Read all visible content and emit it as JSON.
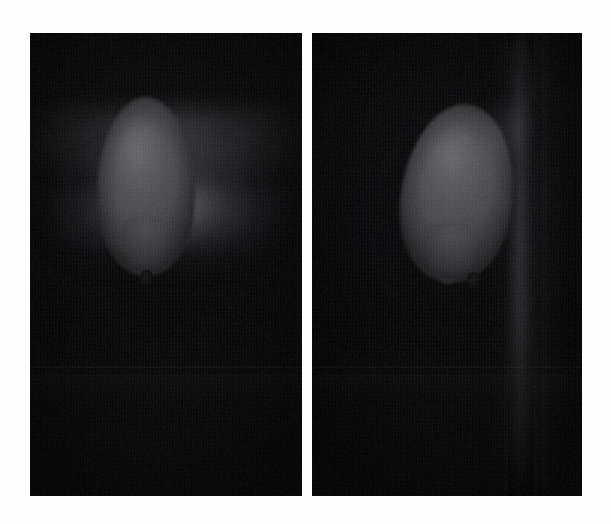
{
  "figure": {
    "background_color": "#fefefe",
    "width": 611,
    "height": 524,
    "caption": "",
    "panel_count": 2
  },
  "panels": [
    {
      "id": "left",
      "label": "",
      "caption": "",
      "frame": {
        "x": 30,
        "y": 33,
        "width": 272,
        "height": 463
      },
      "background_color": "#09090b",
      "subject": "balloon",
      "subject_color": "#4c4c50",
      "subject_position": "upper-center",
      "lighting": "diffuse glow above balloon",
      "glow_color": "#cdcdd2",
      "has_knot": true,
      "knot_color": "#0d0d0f",
      "has_streak": false
    },
    {
      "id": "right",
      "label": "",
      "caption": "",
      "frame": {
        "x": 312,
        "y": 33,
        "width": 270,
        "height": 463
      },
      "background_color": "#08080a",
      "subject": "balloon",
      "subject_color": "#4e4e52",
      "subject_position": "upper-center-left",
      "subject_rotation_deg": 7,
      "lighting": "vertical light streak right of balloon",
      "glow_color": "#afafb9",
      "has_knot": true,
      "knot_color": "#0d0d0f",
      "has_streak": true,
      "streak_position": "right-of-subject"
    }
  ],
  "colors": {
    "page_background": "#fefefe",
    "panel_dark": "#08080a",
    "balloon_gray": "#4c4c50",
    "balloon_highlight": "#5e5e62",
    "knot_black": "#0d0d0f",
    "glow_white": "#cdcdd2"
  }
}
